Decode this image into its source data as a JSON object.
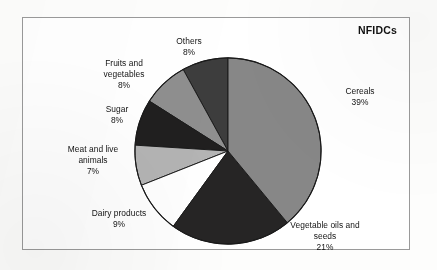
{
  "chart": {
    "title": "NFIDCs"
  },
  "chart_data": {
    "type": "pie",
    "title": "NFIDCs",
    "xlabel": "",
    "ylabel": "",
    "units": "percent",
    "total": 100,
    "start_angle_deg": 90,
    "direction": "counterclockwise",
    "legend": "none (direct labels)",
    "grid": false,
    "categories": [
      "Others",
      "Fruits and vegetables",
      "Sugar",
      "Meat and live animals",
      "Dairy products",
      "Vegetable oils and seeds",
      "Cereals"
    ],
    "values": [
      8,
      8,
      8,
      7,
      9,
      21,
      39
    ],
    "slices": [
      {
        "label": "Others",
        "value": 8,
        "value_text": "8%",
        "color": "#3d3d3d",
        "label_lines": [
          "Others",
          "8%"
        ]
      },
      {
        "label": "Fruits and vegetables",
        "value": 8,
        "value_text": "8%",
        "color": "#8f8f8f",
        "label_lines": [
          "Fruits and",
          "vegetables",
          "8%"
        ]
      },
      {
        "label": "Sugar",
        "value": 8,
        "value_text": "8%",
        "color": "#201f1f",
        "label_lines": [
          "Sugar",
          "8%"
        ]
      },
      {
        "label": "Meat and live animals",
        "value": 7,
        "value_text": "7%",
        "color": "#b4b4b4",
        "label_lines": [
          "Meat and live",
          "animals",
          "7%"
        ]
      },
      {
        "label": "Dairy products",
        "value": 9,
        "value_text": "9%",
        "color": "#ffffff",
        "label_lines": [
          "Dairy products",
          "9%"
        ]
      },
      {
        "label": "Vegetable oils and seeds",
        "value": 21,
        "value_text": "21%",
        "color": "#262525",
        "label_lines": [
          "Vegetable oils and",
          "seeds",
          "21%"
        ]
      },
      {
        "label": "Cereals",
        "value": 39,
        "value_text": "39%",
        "color": "#878787",
        "label_lines": [
          "Cereals",
          "39%"
        ]
      }
    ]
  },
  "labels": {
    "others": {
      "l1": "Others",
      "l2": "8%"
    },
    "fruits": {
      "l1": "Fruits and",
      "l2": "vegetables",
      "l3": "8%"
    },
    "sugar": {
      "l1": "Sugar",
      "l2": "8%"
    },
    "meat": {
      "l1": "Meat and live",
      "l2": "animals",
      "l3": "7%"
    },
    "dairy": {
      "l1": "Dairy products",
      "l2": "9%"
    },
    "vegoils": {
      "l1": "Vegetable oils and",
      "l2": "seeds",
      "l3": "21%"
    },
    "cereals": {
      "l1": "Cereals",
      "l2": "39%"
    }
  },
  "style": {
    "frame_border": "#9a9a9a",
    "pie_outline": "#1a1a1a",
    "background": "#ffffff"
  }
}
